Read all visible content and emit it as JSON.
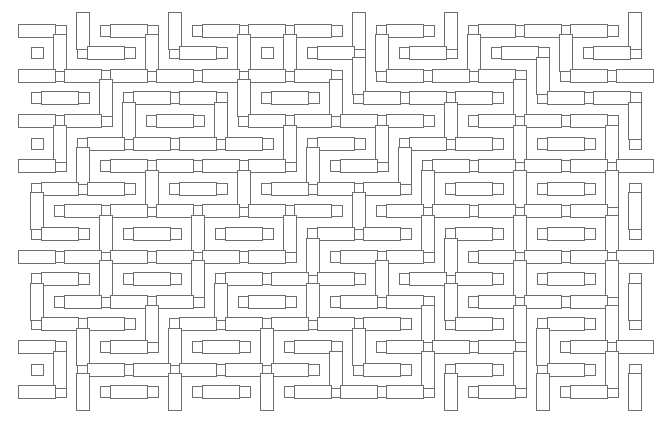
{
  "pattern": {
    "description": "Gray outlined rectangular tiling pattern of horizontal and vertical bars with small square fillers on white",
    "colors": {
      "background": "#ffffff",
      "stroke": "#6e6e6e"
    },
    "grid": {
      "origin_x": 13,
      "origin_y": 12,
      "pitch_x": 23,
      "pitch_y": 22.6,
      "cols": 28,
      "rows": 18,
      "long": 37,
      "short": 13,
      "small": 11
    },
    "orientation_rows": [
      "HVHVHHHVHVHHHV",
      "VHVHVVHVHVHVHV",
      "HHHHHHHVHHHVHH",
      "HVHHVHVHHHVHHH",
      "HHVHVHHHHVHHHV",
      "VHHHHVHVHHVHVH",
      "HVHHHHVHVHHHHH",
      "HHVHVHHHVHVHVH",
      "VHHHHHHVHHHHHV",
      "HVHVHVHHVHVHVH",
      "HHHHHHVHHVHHHH",
      "HVHVHHHVHHVHVH",
      "VHHHVHVHHVHHHV",
      "HHVHHHHHVHVHVH",
      "HVHVHVHVHHHVHH",
      "VHHHHHVHVHVHVH",
      "HVHVHVHHHVHVHV",
      "HHHHHHHVHHHHHH"
    ]
  }
}
